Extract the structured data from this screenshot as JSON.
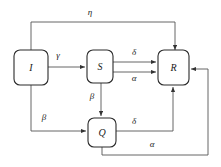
{
  "diagram": {
    "type": "state-transition-flow-diagram",
    "nodes": [
      {
        "id": "I",
        "label": "I",
        "x": 14,
        "y": 50,
        "w": 34,
        "h": 35
      },
      {
        "id": "S",
        "label": "S",
        "x": 87,
        "y": 50,
        "w": 26,
        "h": 33
      },
      {
        "id": "R",
        "label": "R",
        "x": 158,
        "y": 50,
        "w": 31,
        "h": 35
      },
      {
        "id": "Q",
        "label": "Q",
        "x": 88,
        "y": 118,
        "w": 28,
        "h": 29
      }
    ],
    "edges": [
      {
        "from": "I",
        "to": "S",
        "label": "γ",
        "label_x": 58,
        "label_y": 58
      },
      {
        "from": "S",
        "to": "R",
        "label": "δ",
        "label_x": 134,
        "label_y": 55
      },
      {
        "from": "S",
        "to": "R",
        "label": "α",
        "label_x": 134,
        "label_y": 79
      },
      {
        "from": "S",
        "to": "Q",
        "label": "β",
        "label_x": 90,
        "label_y": 97
      },
      {
        "from": "I",
        "to": "Q",
        "label": "β",
        "label_x": 44,
        "label_y": 120
      },
      {
        "from": "Q",
        "to": "R",
        "label": "δ",
        "label_x": 134,
        "label_y": 124
      },
      {
        "from": "Q",
        "to": "R",
        "label": "α",
        "label_x": 152,
        "label_y": 147
      },
      {
        "from": "I",
        "to": "R",
        "label": "η",
        "label_x": 90,
        "label_y": 15
      }
    ],
    "colors": {
      "node_stroke": "#2b2b2b",
      "node_fill": "#ffffff",
      "edge_stroke": "#555555",
      "text": "#1a1a1a",
      "background": "#ffffff"
    }
  }
}
